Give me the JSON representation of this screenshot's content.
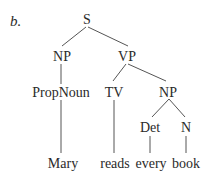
{
  "figure_label": "b.",
  "tree": {
    "nodes": {
      "s": "S",
      "np_subj": "NP",
      "vp": "VP",
      "propnoun": "PropNoun",
      "tv": "TV",
      "np_obj": "NP",
      "det": "Det",
      "n": "N",
      "mary": "Mary",
      "reads": "reads",
      "every": "every",
      "book": "book"
    },
    "edges": [
      [
        "S",
        "NP"
      ],
      [
        "S",
        "VP"
      ],
      [
        "NP",
        "PropNoun"
      ],
      [
        "PropNoun",
        "Mary"
      ],
      [
        "VP",
        "TV"
      ],
      [
        "VP",
        "NP"
      ],
      [
        "TV",
        "reads"
      ],
      [
        "NP",
        "Det"
      ],
      [
        "NP",
        "N"
      ],
      [
        "Det",
        "every"
      ],
      [
        "N",
        "book"
      ]
    ]
  },
  "colors": {
    "text": "#2a2a2a",
    "line": "#555555"
  }
}
